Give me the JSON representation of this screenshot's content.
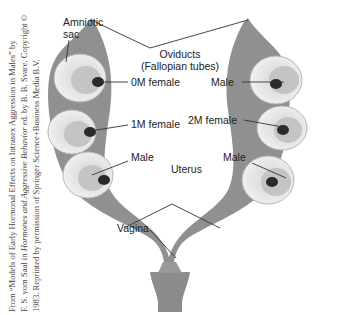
{
  "credit": {
    "line1": "From “Models of Early Hormonal Effects on Intrasex Aggression in Males” by",
    "line2_pre": "F. S. vom Saal in ",
    "line2_italic": "Hormones and Aggressive Behavior",
    "line2_post": " ed. by B. B. Svare. Copyright ©",
    "line3": "1983. Reprinted by permission of Springer Science+Business Media B.V."
  },
  "labels": {
    "amniotic_sac_line1": "Amniotic",
    "amniotic_sac_line2": "sac",
    "oviducts_line1": "Oviducts",
    "oviducts_line2": "(Fallopian tubes)",
    "left_top": "0M female",
    "left_middle": "1M female",
    "left_bottom": "Male",
    "right_top": "Male",
    "right_middle": "2M female",
    "right_bottom": "Male",
    "uterus": "Uterus",
    "vagina": "Vagina"
  },
  "colors": {
    "tissue": "#8f8f8f",
    "tissue_dark": "#6e6e6e",
    "sac": "#e6e6e6",
    "fetus": "#c9c9c9",
    "organ": "#2a2a2a",
    "leader": "#333333"
  }
}
